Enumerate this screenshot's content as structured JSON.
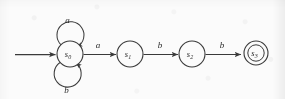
{
  "figure": {
    "kind": "finite-state-automaton",
    "width": 285,
    "height": 99,
    "stroke_color": "#3a3a3a",
    "background_color": "#fbfbfb",
    "text_color": "#2b2b2b"
  },
  "states": [
    {
      "id": "s0",
      "label": "s",
      "subscript": "0",
      "cx": 70,
      "cy": 54,
      "r": 13,
      "accepting": false,
      "start": true
    },
    {
      "id": "s1",
      "label": "s",
      "subscript": "1",
      "cx": 130,
      "cy": 54,
      "r": 13,
      "accepting": false,
      "start": false
    },
    {
      "id": "s2",
      "label": "s",
      "subscript": "2",
      "cx": 192,
      "cy": 54,
      "r": 13,
      "accepting": false,
      "start": false
    },
    {
      "id": "s3",
      "label": "s",
      "subscript": "3",
      "cx": 256,
      "cy": 53,
      "r": 12,
      "r_inner": 8,
      "accepting": true,
      "start": false
    }
  ],
  "transitions": [
    {
      "id": "t-start",
      "from": "",
      "to": "s0",
      "label": "",
      "kind": "start-arrow"
    },
    {
      "id": "t-s0-s0-a",
      "from": "s0",
      "to": "s0",
      "label": "a",
      "kind": "self-loop-top"
    },
    {
      "id": "t-s0-s0-b",
      "from": "s0",
      "to": "s0",
      "label": "b",
      "kind": "self-loop-bottom"
    },
    {
      "id": "t-s0-s1",
      "from": "s0",
      "to": "s1",
      "label": "a",
      "kind": "straight"
    },
    {
      "id": "t-s1-s2",
      "from": "s1",
      "to": "s2",
      "label": "b",
      "kind": "straight"
    },
    {
      "id": "t-s2-s3",
      "from": "s2",
      "to": "s3",
      "label": "b",
      "kind": "straight"
    }
  ],
  "edge_labels": {
    "loop_top": "a",
    "loop_bottom": "b",
    "s0_s1": "a",
    "s1_s2": "b",
    "s2_s3": "b"
  },
  "state_labels": {
    "s0": {
      "base": "s",
      "sub": "0"
    },
    "s1": {
      "base": "s",
      "sub": "1"
    },
    "s2": {
      "base": "s",
      "sub": "2"
    },
    "s3": {
      "base": "s",
      "sub": "3"
    }
  }
}
